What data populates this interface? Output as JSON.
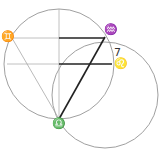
{
  "diagram": {
    "labels": {
      "gemini": "♊",
      "aquarius": "♒",
      "number": "7",
      "leo": "♌",
      "libra": "♎"
    },
    "colors": {
      "circle": "#9a9a9a",
      "thin_line": "#a8a8a8",
      "thick_line": "#222222"
    }
  }
}
